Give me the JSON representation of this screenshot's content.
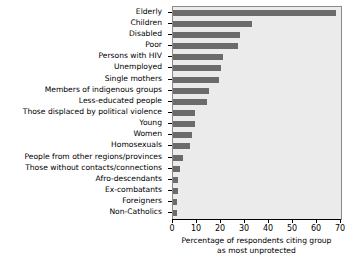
{
  "chart_data": {
    "type": "bar",
    "orientation": "horizontal",
    "title": "",
    "xlabel": "Percentage of respondents citing group as most unprotected",
    "xlabel_line1": "Percentage of respondents citing group",
    "xlabel_line2": "as most unprotected",
    "ylabel": "",
    "xlim": [
      0,
      70
    ],
    "xticks": [
      0,
      10,
      20,
      30,
      40,
      50,
      60,
      70
    ],
    "xtick_labels": [
      "0",
      "10",
      "20",
      "30",
      "40",
      "50",
      "60",
      "70"
    ],
    "grid": false,
    "legend": false,
    "bar_color": "#6b6b6b",
    "panel_color": "#ebebeb",
    "categories": [
      "Elderly",
      "Children",
      "Disabled",
      "Poor",
      "Persons with HIV",
      "Unemployed",
      "Single mothers",
      "Members of indigenous groups",
      "Less-educated people",
      "Those displaced by political violence",
      "Young",
      "Women",
      "Homosexuals",
      "People from other regions/provinces",
      "Those without contacts/connections",
      "Afro-descendants",
      "Ex-combatants",
      "Foreigners",
      "Non-Catholics"
    ],
    "values": [
      68,
      33,
      28,
      27,
      21,
      20,
      19,
      15,
      14,
      9,
      9,
      8,
      7,
      4,
      3,
      2,
      2,
      1.5,
      1.5
    ]
  }
}
